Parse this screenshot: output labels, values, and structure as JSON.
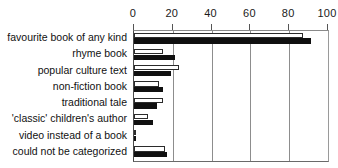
{
  "chart_data": {
    "type": "bar",
    "orientation": "horizontal",
    "title": "",
    "subtitle": "",
    "xlabel": "",
    "ylabel": "",
    "xlim": [
      0,
      100
    ],
    "ylim": null,
    "grid": true,
    "grid_axis": "x",
    "legend": null,
    "legend_position": "none",
    "axis_position": "top",
    "tick_labels": [
      "0",
      "20",
      "40",
      "60",
      "80",
      "100"
    ],
    "tick_values": [
      0,
      20,
      40,
      60,
      80,
      100
    ],
    "categories": [
      "favourite book of any kind",
      "rhyme book",
      "popular culture text",
      "non-fiction book",
      "traditional tale",
      "'classic' children's author",
      "video instead of a book",
      "could not be categorized"
    ],
    "series": [
      {
        "name": "series-open",
        "style": "open",
        "color": "#ffffff",
        "edge_color": "#2b2b2b",
        "values": [
          87,
          15,
          23,
          13,
          15,
          7,
          1,
          16
        ]
      },
      {
        "name": "series-filled",
        "style": "filled",
        "color": "#101010",
        "edge_color": "#101010",
        "values": [
          91,
          21,
          19,
          15,
          12,
          10,
          1,
          17
        ]
      }
    ],
    "annotations": []
  },
  "colors": {
    "background": "#ffffff",
    "axis": "#4a4a4a",
    "gridline": "#8d8d8d",
    "text": "#111111",
    "bar_open_fill": "#ffffff",
    "bar_open_edge": "#2b2b2b",
    "bar_filled_fill": "#101010"
  }
}
